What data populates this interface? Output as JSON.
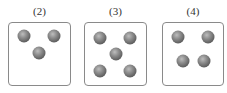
{
  "panels": [
    {
      "label": "(2)",
      "box": {
        "left": 8,
        "width": 63,
        "height": 64
      },
      "balls": [
        [
          15,
          13
        ],
        [
          45,
          13
        ],
        [
          30,
          30
        ]
      ]
    },
    {
      "label": "(3)",
      "box": {
        "left": 84,
        "width": 63,
        "height": 64
      },
      "balls": [
        [
          15,
          15
        ],
        [
          45,
          15
        ],
        [
          31,
          31
        ],
        [
          15,
          48
        ],
        [
          45,
          48
        ]
      ]
    },
    {
      "label": "(4)",
      "box": {
        "left": 162,
        "width": 62,
        "height": 64
      },
      "balls": [
        [
          15,
          14
        ],
        [
          45,
          14
        ],
        [
          20,
          38
        ],
        [
          41,
          38
        ]
      ]
    }
  ],
  "colors": {
    "border": "#8a8a8a",
    "ball": "#6e6e6e"
  }
}
